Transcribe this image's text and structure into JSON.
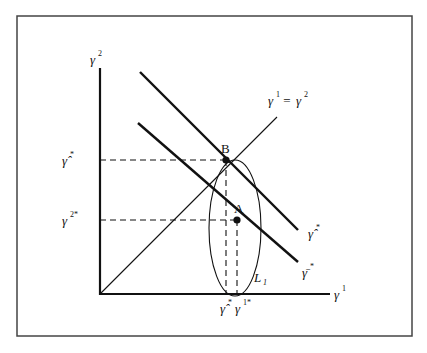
{
  "diagram": {
    "type": "economic-diagram",
    "axes": {
      "x_label": "γ",
      "x_label_sup": "1",
      "y_label": "γ",
      "y_label_sup": "2"
    },
    "lines": {
      "diagonal_label_left": "γ",
      "diagonal_label_left_sup": "1",
      "diagonal_label_eq": " = ",
      "diagonal_label_right": "γ",
      "diagonal_label_right_sup": "2",
      "upper_line_label": "γ̂",
      "upper_line_label_sup": "*",
      "lower_line_label": "γ̄",
      "lower_line_label_sup": "*"
    },
    "points": {
      "B": "B",
      "A": "A"
    },
    "ticks": {
      "y_upper": "γ̂",
      "y_upper_sup": "*",
      "y_lower": "γ",
      "y_lower_sup": "2*",
      "x_left": "γ̂",
      "x_left_sup": "*",
      "x_right": "γ",
      "x_right_sup": "1*"
    },
    "curve_label": "L",
    "curve_label_sub": "1",
    "colors": {
      "ink": "#111111",
      "frame": "#444444",
      "background": "#ffffff"
    }
  }
}
